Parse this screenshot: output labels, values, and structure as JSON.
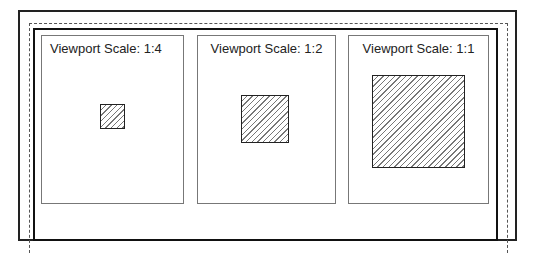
{
  "diagram": {
    "panels": [
      {
        "title": "Viewport Scale: 1:4",
        "scale": "1:4",
        "square_size": 22
      },
      {
        "title": "Viewport Scale: 1:2",
        "scale": "1:2",
        "square_size": 45
      },
      {
        "title": "Viewport Scale: 1:1",
        "scale": "1:1",
        "square_size": 90
      }
    ],
    "colors": {
      "frame": "#222222",
      "dashed": "#555555",
      "panel_border": "#777777",
      "hatch": "#777777"
    }
  }
}
